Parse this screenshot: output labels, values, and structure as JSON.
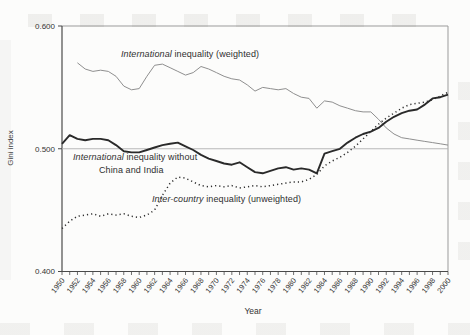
{
  "chart_data": {
    "type": "line",
    "title": "",
    "xlabel": "Year",
    "ylabel": "Gini index",
    "x_axis": {
      "min": 1950,
      "max": 2000,
      "minor_step": 1,
      "label_step": 2,
      "labels": [
        "1950",
        "1952",
        "1954",
        "1956",
        "1958",
        "1960",
        "1962",
        "1964",
        "1966",
        "1968",
        "1970",
        "1972",
        "1974",
        "1976",
        "1978",
        "1980",
        "1982",
        "1984",
        "1986",
        "1988",
        "1990",
        "1992",
        "1994",
        "1996",
        "1998",
        "2000"
      ]
    },
    "y_axis": {
      "min": 0.4,
      "max": 0.6,
      "ticks": [
        {
          "value": 0.6,
          "label": "0.600"
        },
        {
          "value": 0.5,
          "label": "0.500"
        },
        {
          "value": 0.4,
          "label": "0.400"
        }
      ]
    },
    "reference_line": {
      "value": 0.5,
      "color": "#b0b0b0"
    },
    "grid": "off",
    "legend_position": "inline-annotations",
    "series": [
      {
        "id": "international-weighted",
        "label": {
          "italic": "International",
          "rest": " inequality (weighted)"
        },
        "style": {
          "stroke": "#8f8f8f",
          "width": 1.0,
          "dash": ""
        },
        "start_year": 1952,
        "values": [
          0.57,
          0.565,
          0.563,
          0.564,
          0.563,
          0.559,
          0.551,
          0.548,
          0.549,
          0.559,
          0.568,
          0.569,
          0.566,
          0.563,
          0.56,
          0.562,
          0.567,
          0.565,
          0.562,
          0.559,
          0.557,
          0.556,
          0.552,
          0.547,
          0.55,
          0.549,
          0.548,
          0.549,
          0.545,
          0.542,
          0.541,
          0.533,
          0.539,
          0.538,
          0.535,
          0.533,
          0.531,
          0.53,
          0.53,
          0.524,
          0.517,
          0.512,
          0.509,
          0.508,
          0.507,
          0.506,
          0.505,
          0.504,
          0.503
        ]
      },
      {
        "id": "international-without-china-india",
        "label": {
          "italic": "International",
          "rest": " inequality without",
          "line2": "China and India"
        },
        "style": {
          "stroke": "#2a2a2a",
          "width": 1.9,
          "dash": ""
        },
        "start_year": 1950,
        "values": [
          0.504,
          0.511,
          0.508,
          0.507,
          0.508,
          0.508,
          0.507,
          0.503,
          0.498,
          0.497,
          0.497,
          0.499,
          0.501,
          0.503,
          0.504,
          0.505,
          0.502,
          0.499,
          0.495,
          0.492,
          0.49,
          0.488,
          0.487,
          0.489,
          0.485,
          0.481,
          0.48,
          0.482,
          0.484,
          0.485,
          0.483,
          0.484,
          0.483,
          0.48,
          0.496,
          0.498,
          0.5,
          0.505,
          0.509,
          0.512,
          0.514,
          0.517,
          0.522,
          0.526,
          0.529,
          0.531,
          0.532,
          0.536,
          0.541,
          0.542,
          0.544
        ]
      },
      {
        "id": "inter-country-unweighted",
        "label": {
          "italic": "Inter-country",
          "rest": " inequality (unweighted)"
        },
        "style": {
          "stroke": "#2e2e2e",
          "width": 1.5,
          "dash": "1.2 3"
        },
        "start_year": 1950,
        "values": [
          0.435,
          0.441,
          0.445,
          0.446,
          0.447,
          0.445,
          0.447,
          0.446,
          0.447,
          0.445,
          0.444,
          0.446,
          0.45,
          0.462,
          0.472,
          0.477,
          0.476,
          0.473,
          0.47,
          0.469,
          0.47,
          0.469,
          0.47,
          0.468,
          0.469,
          0.47,
          0.469,
          0.47,
          0.471,
          0.472,
          0.473,
          0.473,
          0.475,
          0.479,
          0.486,
          0.49,
          0.493,
          0.497,
          0.502,
          0.508,
          0.514,
          0.52,
          0.525,
          0.529,
          0.533,
          0.536,
          0.537,
          0.538,
          0.54,
          0.543,
          0.546
        ]
      }
    ],
    "colors": {
      "axis_dark": "#4a4a4a",
      "axis_light": "#9b9b9b",
      "text": "#333333"
    }
  }
}
